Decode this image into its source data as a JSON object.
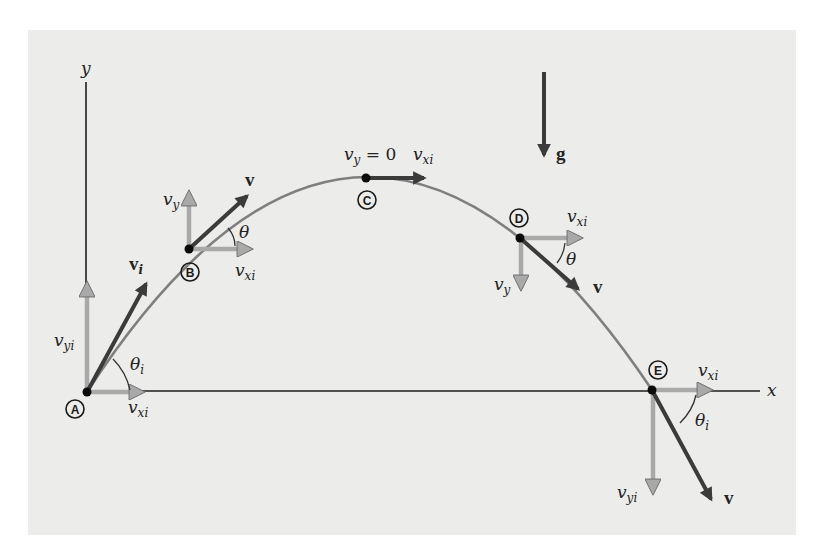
{
  "figure": {
    "type": "projectile-motion-diagram",
    "axes": {
      "x_label": "x",
      "y_label": "y"
    },
    "gravity": {
      "label": "g"
    },
    "points": [
      {
        "id": "A",
        "label": "A",
        "components": [
          "v_yi",
          "v_xi"
        ],
        "velocity_label": "v_i",
        "angle_label": "θ_i"
      },
      {
        "id": "B",
        "label": "B",
        "components": [
          "v_y",
          "v_xi"
        ],
        "velocity_label": "v",
        "angle_label": "θ"
      },
      {
        "id": "C",
        "label": "C",
        "annotation": "v_y = 0",
        "components": [
          "v_xi"
        ]
      },
      {
        "id": "D",
        "label": "D",
        "components": [
          "v_xi",
          "v_y"
        ],
        "velocity_label": "v",
        "angle_label": "θ"
      },
      {
        "id": "E",
        "label": "E",
        "components": [
          "v_xi",
          "v_yi"
        ],
        "velocity_label": "v",
        "angle_label": "θ_i"
      }
    ]
  },
  "labels": {
    "x": "x",
    "y": "y",
    "g": "g",
    "v_base": "v",
    "v_bold": "v",
    "sub_i": "i",
    "sub_y": "y",
    "sub_yi": "yi",
    "sub_xi": "xi",
    "theta": "θ",
    "eq_zero": " = 0",
    "A": "A",
    "B": "B",
    "C": "C",
    "D": "D",
    "E": "E"
  },
  "colors": {
    "panel": "#ececeb",
    "trajectory": "#7f7f7f",
    "component_arrow": "#a9a9a9",
    "velocity_arrow": "#3b3b3b",
    "axis": "#1e1e1e"
  }
}
